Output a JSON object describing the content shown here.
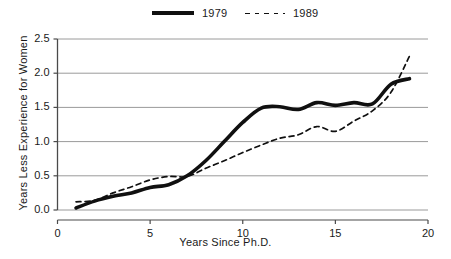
{
  "legend": {
    "position": "top-center",
    "entries": [
      {
        "label": "1979",
        "style": "solid",
        "icon": "solid-line-swatch-icon"
      },
      {
        "label": "1989",
        "style": "dashed",
        "icon": "dashed-line-swatch-icon"
      }
    ]
  },
  "axes": {
    "x": {
      "label": "Years Since Ph.D.",
      "ticks": [
        "0",
        "5",
        "10",
        "15",
        "20"
      ],
      "min": 0,
      "max": 20
    },
    "y": {
      "label": "Years Less Experience for Women",
      "ticks": [
        "0.0",
        "0.5",
        "1.0",
        "1.5",
        "2.0",
        "2.5"
      ],
      "min": 0,
      "max": 2.5
    }
  },
  "colors": {
    "line": "#101010",
    "grid": "#9a9a9a",
    "axis": "#4a4a4a",
    "text": "#1a1a1a",
    "background": "#ffffff"
  },
  "chart_data": {
    "type": "line",
    "title": "",
    "xlabel": "Years Since Ph.D.",
    "ylabel": "Years Less Experience for Women",
    "xlim": [
      0,
      20
    ],
    "ylim": [
      0,
      2.5
    ],
    "xticks": [
      0,
      5,
      10,
      15,
      20
    ],
    "yticks": [
      0.0,
      0.5,
      1.0,
      1.5,
      2.0,
      2.5
    ],
    "grid": "horizontal",
    "legend_position": "top-center",
    "x": [
      1,
      2,
      3,
      4,
      5,
      6,
      7,
      8,
      9,
      10,
      11,
      12,
      13,
      14,
      15,
      16,
      17,
      18,
      19
    ],
    "series": [
      {
        "name": "1979",
        "style": "solid",
        "values": [
          0.03,
          0.13,
          0.2,
          0.25,
          0.33,
          0.37,
          0.5,
          0.72,
          1.0,
          1.28,
          1.49,
          1.51,
          1.47,
          1.57,
          1.53,
          1.57,
          1.55,
          1.84,
          1.92
        ]
      },
      {
        "name": "1989",
        "style": "dashed",
        "values": [
          0.12,
          0.14,
          0.25,
          0.34,
          0.44,
          0.49,
          0.49,
          0.61,
          0.72,
          0.84,
          0.95,
          1.05,
          1.1,
          1.22,
          1.15,
          1.3,
          1.45,
          1.72,
          2.25
        ]
      }
    ]
  }
}
